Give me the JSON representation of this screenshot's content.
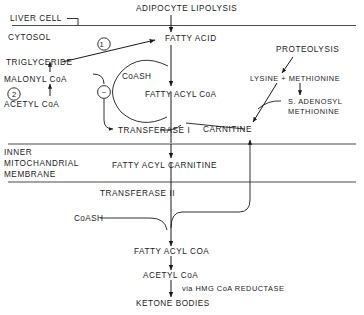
{
  "diagram": {
    "compartments": {
      "liver_cell": "LIVER CELL",
      "cytosol": "CYTOSOL",
      "inner_membrane_line1": "INNER",
      "inner_membrane_line2": "MITOCHANDRIAL",
      "inner_membrane_line3": "MEMBRANE"
    },
    "nodes": {
      "adipocyte_lipolysis": "ADIPOCYTE LIPOLYSIS",
      "fatty_acid": "FATTY ACID",
      "triglyceride": "TRIGLYCERIDE",
      "malonyl_coa": "MALONYL CoA",
      "acetyl_coa_cytosol": "ACETYL CoA",
      "coash_upper": "CoASH",
      "fatty_acyl_coa_upper": "FATTY ACYL CoA",
      "transferase_i": "TRANSFERASE I",
      "proteolysis": "PROTEOLYSIS",
      "lysine_methionine": "LYSINE + METHIONINE",
      "s_adenosyl_line1": "S. ADENOSYL",
      "s_adenosyl_line2": "METHIONINE",
      "carnitine": "CARNITINE",
      "fatty_acyl_carnitine": "FATTY ACYL CARNITINE",
      "transferase_ii": "TRANSFERASE II",
      "coash_lower": "CoASH",
      "fatty_acyl_coa_lower": "FATTY ACYL COA",
      "acetyl_coa_mito": "ACETYL CoA",
      "ketone_bodies": "KETONE BODIES",
      "via_hmg": "via HMG CoA REDUCTASE"
    },
    "markers": {
      "step_one": "1",
      "step_two": "2",
      "inhibition": "−"
    },
    "colors": {
      "ink": "#1b1b1b",
      "membrane": "#4a4a4a",
      "background": "#ffffff"
    }
  }
}
